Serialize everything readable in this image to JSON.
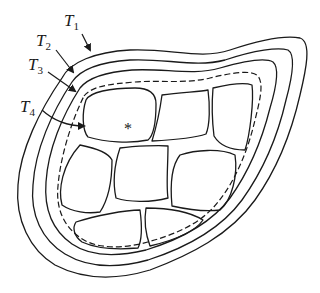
{
  "diagram": {
    "type": "cross-section tissue layers",
    "labels": [
      {
        "id": "T1",
        "letter": "T",
        "subscript": "1"
      },
      {
        "id": "T2",
        "letter": "T",
        "subscript": "2"
      },
      {
        "id": "T3",
        "letter": "T",
        "subscript": "3"
      },
      {
        "id": "T4",
        "letter": "T",
        "subscript": "4"
      }
    ],
    "marker": "*",
    "colors": {
      "line": "#1a1a1a",
      "background": "#ffffff"
    }
  }
}
